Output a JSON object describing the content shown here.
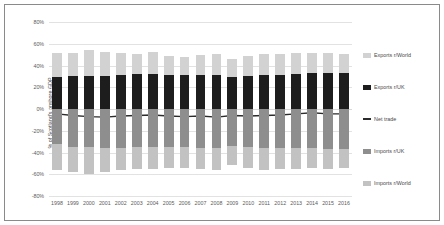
{
  "chart_data": {
    "type": "bar",
    "title": "",
    "subtitle": "",
    "xlabel": "",
    "ylabel": "% of Scotland's onshore GDP",
    "ylim": [
      -80,
      80
    ],
    "yticks": [
      "80%",
      "60%",
      "40%",
      "20%",
      "0%",
      "-20%",
      "-40%",
      "-60%",
      "-80%"
    ],
    "ytick_values": [
      80,
      60,
      40,
      20,
      0,
      -20,
      -40,
      -60,
      -80
    ],
    "grid": true,
    "legend_position": "right",
    "stacked": true,
    "categories": [
      "1998",
      "1999",
      "2000",
      "2001",
      "2002",
      "2003",
      "2004",
      "2005",
      "2006",
      "2007",
      "2008",
      "2009",
      "2010",
      "2011",
      "2012",
      "2013",
      "2014",
      "2015",
      "2016"
    ],
    "legend": [
      "Exports r/World",
      "Exports r/UK",
      "Net trade",
      "Imports r/UK",
      "Imports r/World"
    ],
    "series": [
      {
        "name": "Exports r/World",
        "type": "bar",
        "color": "#d2d2d2",
        "values": [
          22.0,
          21.5,
          23.5,
          21.5,
          20.0,
          18.5,
          19.5,
          17.0,
          16.5,
          18.5,
          19.5,
          17.0,
          18.5,
          19.5,
          19.0,
          19.0,
          18.0,
          18.5,
          18.0
        ]
      },
      {
        "name": "Exports r/UK",
        "type": "bar",
        "color": "#1d1d1d",
        "values": [
          29.5,
          30.0,
          30.5,
          30.5,
          31.5,
          32.0,
          32.5,
          31.5,
          31.5,
          31.5,
          31.0,
          29.0,
          30.0,
          31.5,
          31.5,
          32.5,
          33.5,
          33.0,
          33.0
        ]
      },
      {
        "name": "Imports r/UK",
        "type": "bar",
        "color": "#8e8e8e",
        "values": [
          -32.5,
          -34.5,
          -35.0,
          -35.5,
          -35.5,
          -35.0,
          -35.0,
          -34.5,
          -35.0,
          -35.5,
          -36.0,
          -34.0,
          -34.5,
          -35.5,
          -35.5,
          -35.5,
          -36.0,
          -36.5,
          -36.5
        ]
      },
      {
        "name": "Imports r/World",
        "type": "bar",
        "color": "#c2c2c2",
        "values": [
          -23.5,
          -23.0,
          -24.5,
          -22.5,
          -21.0,
          -20.0,
          -20.0,
          -19.5,
          -19.0,
          -19.5,
          -20.5,
          -17.5,
          -19.5,
          -20.5,
          -20.0,
          -19.5,
          -18.0,
          -18.5,
          -18.0
        ]
      },
      {
        "name": "Net trade",
        "type": "line",
        "color": "#2b2b2b",
        "values": [
          -4.5,
          -6.0,
          -7.0,
          -7.5,
          -6.5,
          -6.0,
          -5.5,
          -6.5,
          -7.0,
          -6.5,
          -7.5,
          -6.0,
          -6.5,
          -6.0,
          -5.5,
          -4.5,
          -3.5,
          -4.5,
          -4.5
        ]
      }
    ]
  }
}
